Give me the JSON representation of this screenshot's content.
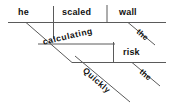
{
  "diagram": {
    "type": "reed-kellogg-sentence-diagram",
    "sentence": "He quickly scaled the wall, calculating the risk.",
    "ink_color": "#111111",
    "line_color": "#5a5a5a",
    "background_color": "#ffffff",
    "main_clause": {
      "subject": "he",
      "verb": "scaled",
      "direct_object": "wall",
      "object_modifier": "the"
    },
    "participial_phrase": {
      "participle": "calculating",
      "object": "risk",
      "object_modifier": "the",
      "adverb": "Quickly"
    },
    "words": [
      {
        "id": "subject",
        "label": "he"
      },
      {
        "id": "verb",
        "label": "scaled"
      },
      {
        "id": "direct-object",
        "label": "wall"
      },
      {
        "id": "article-wall",
        "label": "the"
      },
      {
        "id": "participle",
        "label": "calculating"
      },
      {
        "id": "participle-object",
        "label": "risk"
      },
      {
        "id": "article-risk",
        "label": "the"
      },
      {
        "id": "adverb",
        "label": "Quickly"
      }
    ]
  }
}
